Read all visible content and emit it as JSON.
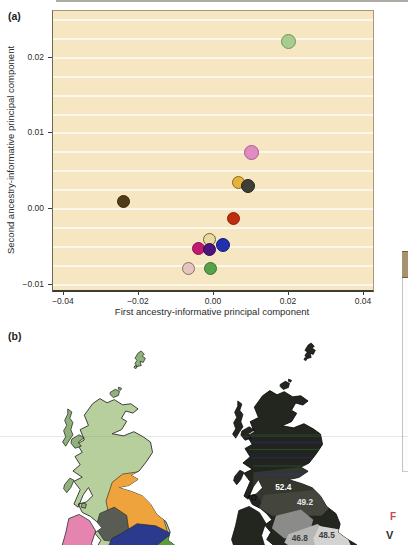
{
  "panel_a": {
    "label": "(a)"
  },
  "chart_data": {
    "type": "scatter",
    "title": "",
    "xlabel": "First ancestry-informative principal component",
    "ylabel": "Second ancestry-informative principal component",
    "xlim": [
      -0.0429,
      0.0424
    ],
    "ylim": [
      -0.0107,
      0.0262
    ],
    "xticks": [
      -0.04,
      -0.02,
      0,
      0.02,
      0.04
    ],
    "yticks": [
      -0.01,
      0,
      0.01,
      0.02
    ],
    "grid_step": 0.0025,
    "grid": "horizontal-white-lines",
    "legend": "none",
    "plot_bg": "#f6e6c1",
    "points": [
      {
        "name": "light-green",
        "x": 0.02,
        "y": 0.0222,
        "fill": "#a9cb90",
        "stroke": "#679a58",
        "size": 15
      },
      {
        "name": "orchid-pink",
        "x": 0.01,
        "y": 0.0075,
        "fill": "#e18cc1",
        "stroke": "#a85b92",
        "size": 15
      },
      {
        "name": "amber",
        "x": 0.0065,
        "y": 0.0035,
        "fill": "#e5b23c",
        "stroke": "#8a6a20",
        "size": 13
      },
      {
        "name": "charcoal",
        "x": 0.009,
        "y": 0.003,
        "fill": "#3e3e37",
        "stroke": "#23231d",
        "size": 14
      },
      {
        "name": "dark-brown",
        "x": -0.024,
        "y": 0.001,
        "fill": "#523c17",
        "stroke": "#36270d",
        "size": 13
      },
      {
        "name": "red",
        "x": 0.0053,
        "y": -0.0012,
        "fill": "#c02d0e",
        "stroke": "#8c1f07",
        "size": 13
      },
      {
        "name": "cream",
        "x": -0.0012,
        "y": -0.004,
        "fill": "#ead9a1",
        "stroke": "#6f6434",
        "size": 13
      },
      {
        "name": "royal-blue",
        "x": 0.0024,
        "y": -0.0047,
        "fill": "#2130ab",
        "stroke": "#131c78",
        "size": 14
      },
      {
        "name": "magenta",
        "x": -0.004,
        "y": -0.0052,
        "fill": "#c31a71",
        "stroke": "#8e0f4f",
        "size": 13
      },
      {
        "name": "dark-purple",
        "x": -0.0013,
        "y": -0.0053,
        "fill": "#4c157d",
        "stroke": "#310950",
        "size": 13
      },
      {
        "name": "pale-pink",
        "x": -0.0067,
        "y": -0.0078,
        "fill": "#e4c5bf",
        "stroke": "#8f6e66",
        "size": 13
      },
      {
        "name": "green",
        "x": -0.001,
        "y": -0.0078,
        "fill": "#57a14b",
        "stroke": "#3a7431",
        "size": 13
      }
    ]
  },
  "panel_b": {
    "label": "(b)",
    "left_map": {
      "colors": {
        "scotland": "#b7cf9c",
        "hebrides": "#8fb27a",
        "northumbria": "#efa33c",
        "cumbria": "#585c55",
        "yorkshire": "#2c3a8e",
        "green_region": "#5e9b3f",
        "pink_region": "#e584ae"
      }
    },
    "right_map": {
      "colors": {
        "dark": "#23251f",
        "shade1": "#35372f",
        "shade2": "#44463e",
        "gray_mid": "#8b8b89",
        "gray_light": "#b6b6b4",
        "gray_lightest": "#d3d3d1",
        "stripe_green": "#2c6b2f",
        "stripe_blue": "#27339b"
      },
      "value_labels": [
        {
          "text": "52.4",
          "color": "#ffffff"
        },
        {
          "text": "49.2",
          "color": "#e8e8e8"
        },
        {
          "text": "46.8",
          "color": "#3c3c3c"
        },
        {
          "text": "48.5",
          "color": "#3c3c3c"
        }
      ]
    }
  },
  "fragments": {
    "caption_letter": "F",
    "caption_letter2": "V"
  }
}
